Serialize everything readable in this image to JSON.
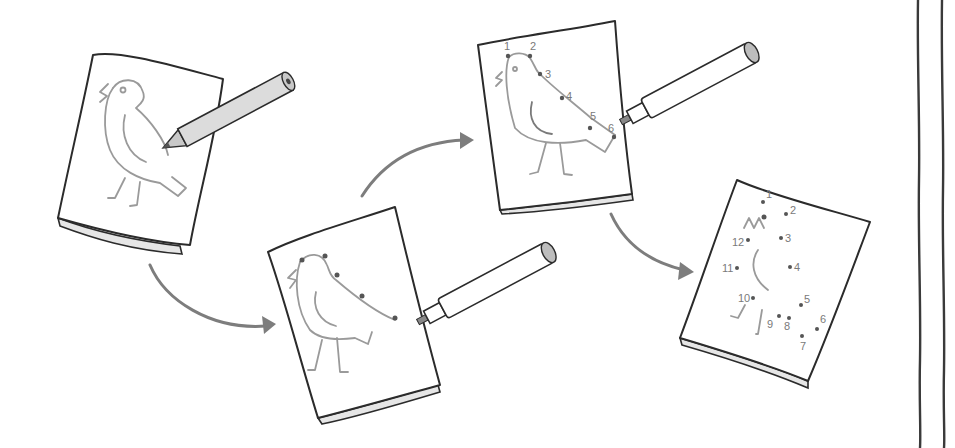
{
  "illustration": {
    "description": "Steps for making a connect-the-dots drawing of a bird",
    "colors": {
      "background": "#ffffff",
      "ink": "#2b2b2b",
      "pencil_gray": "#9a9a9a",
      "arrow": "#7d7d7d"
    },
    "steps": [
      {
        "id": "step-1",
        "label": "Draw the bird outline with a pencil",
        "tool": "pencil-icon"
      },
      {
        "id": "step-2",
        "label": "Mark dots along the outline with a pen",
        "tool": "pen-icon"
      },
      {
        "id": "step-3",
        "label": "Number the dots in order",
        "tool": "pen-icon",
        "numbers": [
          "1",
          "2",
          "3",
          "4",
          "5",
          "6"
        ]
      },
      {
        "id": "step-4",
        "label": "Finished connect-the-dots puzzle",
        "numbers": [
          "1",
          "2",
          "3",
          "4",
          "5",
          "6",
          "7",
          "8",
          "9",
          "10",
          "11",
          "12"
        ]
      }
    ],
    "arrows": [
      {
        "from": "step-1",
        "to": "step-2"
      },
      {
        "from": "step-2",
        "to": "step-3"
      },
      {
        "from": "step-3",
        "to": "step-4"
      }
    ]
  }
}
